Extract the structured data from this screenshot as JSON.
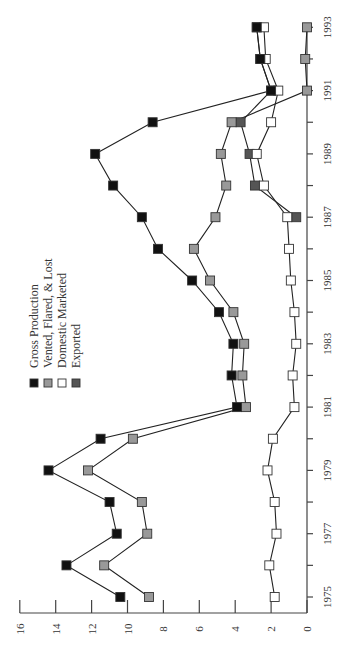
{
  "chart_data": {
    "type": "line",
    "orientation": "rotated-90-ccw",
    "title": "",
    "xlabel": "",
    "ylabel": "",
    "x": [
      1975,
      1976,
      1977,
      1978,
      1979,
      1980,
      1981,
      1982,
      1983,
      1984,
      1985,
      1986,
      1987,
      1988,
      1989,
      1990,
      1991,
      1992,
      1993
    ],
    "xticks": [
      1975,
      1977,
      1979,
      1981,
      1983,
      1985,
      1987,
      1989,
      1991,
      1993
    ],
    "yticks": [
      0,
      2,
      4,
      6,
      8,
      10,
      12,
      14,
      16
    ],
    "ylim": [
      0,
      16
    ],
    "xlim": [
      1975,
      1993
    ],
    "grid": false,
    "legend_position": "upper-left (rotated)",
    "series": [
      {
        "name": "Gross Production",
        "marker_color": "#111111",
        "values": [
          10.4,
          13.4,
          10.6,
          11.0,
          14.4,
          11.5,
          3.9,
          4.2,
          4.1,
          4.9,
          6.4,
          8.3,
          9.2,
          10.8,
          11.8,
          8.6,
          2.0,
          2.6,
          2.8
        ]
      },
      {
        "name": "Vented, Flared, & Lost",
        "marker_color": "#999999",
        "values": [
          8.8,
          11.3,
          8.9,
          9.2,
          12.2,
          9.7,
          3.4,
          3.6,
          3.5,
          4.1,
          5.4,
          6.3,
          5.1,
          4.5,
          4.8,
          4.2,
          0.0,
          0.1,
          0.0
        ]
      },
      {
        "name": "Domestic Marketed",
        "marker_color": "#ffffff",
        "values": [
          1.8,
          2.1,
          1.7,
          1.8,
          2.2,
          1.9,
          0.7,
          0.8,
          0.6,
          0.7,
          0.9,
          1.0,
          1.1,
          2.4,
          2.8,
          2.0,
          1.6,
          2.3,
          2.4
        ]
      },
      {
        "name": "Exported",
        "marker_color": "#555555",
        "values": [
          null,
          null,
          null,
          null,
          null,
          null,
          null,
          null,
          null,
          null,
          null,
          null,
          0.6,
          2.9,
          3.2,
          3.7,
          2.0,
          2.6,
          2.8
        ]
      }
    ]
  },
  "legend": {
    "items": [
      {
        "label": "Gross Production",
        "color": "#111111"
      },
      {
        "label": "Vented, Flared, & Lost",
        "color": "#999999"
      },
      {
        "label": "Domestic Marketed",
        "color": "#ffffff"
      },
      {
        "label": "Exported",
        "color": "#555555"
      }
    ]
  },
  "colors": {
    "axis": "#444444",
    "line": "#222222",
    "marker_stroke": "#333333"
  }
}
